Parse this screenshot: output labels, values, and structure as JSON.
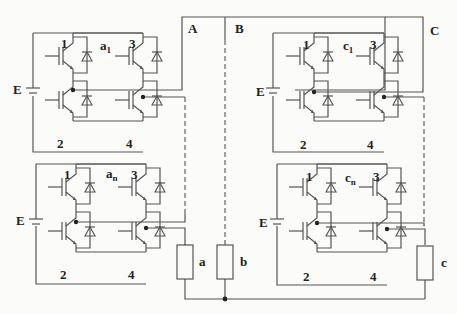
{
  "diagram": {
    "type": "cascaded H-bridge multilevel inverter",
    "phases": [
      {
        "label": "A",
        "load_label": "a",
        "cells": [
          "a1",
          "an"
        ]
      },
      {
        "label": "B",
        "load_label": "b",
        "cells": []
      },
      {
        "label": "C",
        "load_label": "c",
        "cells": [
          "c1",
          "cn"
        ]
      }
    ],
    "cells": [
      {
        "id": "a1",
        "label_main": "a",
        "label_sub": "1",
        "source_label": "E",
        "switch_labels": [
          "1",
          "2",
          "3",
          "4"
        ]
      },
      {
        "id": "an",
        "label_main": "a",
        "label_sub": "n",
        "source_label": "E",
        "switch_labels": [
          "1",
          "2",
          "3",
          "4"
        ]
      },
      {
        "id": "c1",
        "label_main": "c",
        "label_sub": "1",
        "source_label": "E",
        "switch_labels": [
          "1",
          "2",
          "3",
          "4"
        ]
      },
      {
        "id": "cn",
        "label_main": "c",
        "label_sub": "n",
        "source_label": "E",
        "switch_labels": [
          "1",
          "2",
          "3",
          "4"
        ]
      }
    ],
    "terminal_labels": {
      "A": "A",
      "B": "B",
      "C": "C"
    },
    "load_labels": {
      "a": "a",
      "b": "b",
      "c": "c"
    },
    "line_color": "#555555",
    "text_color": "#222222",
    "background": "#fbfbfa"
  }
}
